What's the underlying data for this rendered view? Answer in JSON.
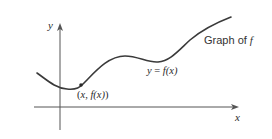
{
  "figure": {
    "axes": {
      "x_label": "x",
      "y_label": "y"
    },
    "curve_label": {
      "prefix": "Graph of ",
      "name": "f"
    },
    "equation_label": {
      "lhs": "y",
      "eq": " = ",
      "rhs": "f(x)"
    },
    "point_label": {
      "open": "(",
      "x": "x",
      "sep": ", ",
      "fx": "f(x)",
      "close": ")"
    },
    "colors": {
      "curve": "#3a3a3a",
      "axes": "#555555",
      "text": "#2a2a2a",
      "background": "#ffffff"
    }
  }
}
